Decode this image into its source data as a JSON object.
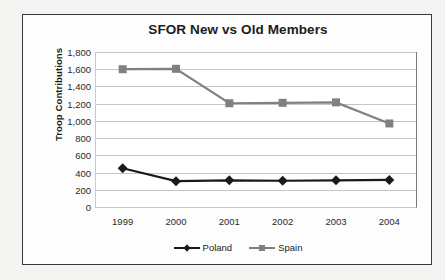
{
  "chart_data": {
    "type": "line",
    "title": "SFOR New vs Old Members",
    "xlabel": "",
    "ylabel": "Troop Contributions",
    "categories": [
      "1999",
      "2000",
      "2001",
      "2002",
      "2003",
      "2004"
    ],
    "series": [
      {
        "name": "Poland",
        "color": "#1a1a1a",
        "marker": "diamond",
        "values": [
          450,
          300,
          310,
          305,
          310,
          315
        ]
      },
      {
        "name": "Spain",
        "color": "#808080",
        "marker": "square",
        "values": [
          1600,
          1605,
          1205,
          1210,
          1215,
          970
        ]
      }
    ],
    "ylim": [
      0,
      1800
    ],
    "y_ticks": [
      0,
      200,
      400,
      600,
      800,
      1000,
      1200,
      1400,
      1600,
      1800
    ],
    "y_tick_labels": [
      "0",
      "200",
      "400",
      "600",
      "800",
      "1,000",
      "1,200",
      "1,400",
      "1,600",
      "1,800"
    ],
    "grid": true,
    "legend_position": "bottom"
  }
}
